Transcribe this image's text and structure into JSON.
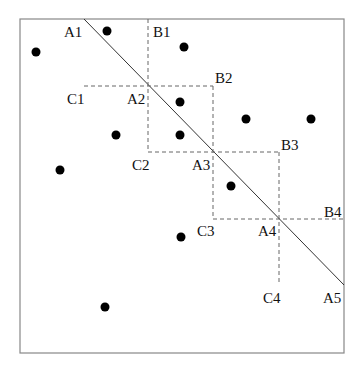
{
  "diagram": {
    "frame": {
      "x1": 20,
      "y1": 19,
      "x2": 344,
      "y2": 353,
      "color": "#888888"
    },
    "diagonal": {
      "x1": 84,
      "y1": 19,
      "x2": 344,
      "y2": 285,
      "color": "#333333"
    },
    "labels": {
      "A1": "A1",
      "A2": "A2",
      "A3": "A3",
      "A4": "A4",
      "A5": "A5",
      "B1": "B1",
      "B2": "B2",
      "B3": "B3",
      "B4": "B4",
      "C1": "C1",
      "C2": "C2",
      "C3": "C3",
      "C4": "C4"
    },
    "points": [
      [
        36,
        52
      ],
      [
        107,
        31
      ],
      [
        184,
        47
      ],
      [
        180,
        102
      ],
      [
        116,
        135
      ],
      [
        180,
        135
      ],
      [
        246,
        119
      ],
      [
        311,
        119
      ],
      [
        60,
        170
      ],
      [
        231,
        186
      ],
      [
        181,
        237
      ],
      [
        105,
        307
      ]
    ]
  }
}
